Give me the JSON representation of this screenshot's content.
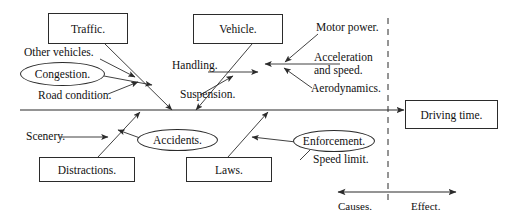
{
  "diagram": {
    "type": "fishbone-cause-and-effect",
    "colors": {
      "stroke": "#2b2b2b",
      "text": "#111111",
      "background": "#ffffff"
    },
    "effect_box": {
      "label": "Driving time."
    },
    "category_boxes": [
      {
        "id": "traffic",
        "label": "Traffic.",
        "position": "top-left"
      },
      {
        "id": "vehicle",
        "label": "Vehicle.",
        "position": "top-right"
      },
      {
        "id": "distractions",
        "label": "Distractions.",
        "position": "bottom-left"
      },
      {
        "id": "laws",
        "label": "Laws.",
        "position": "bottom-right"
      }
    ],
    "ellipses": [
      {
        "id": "congestion",
        "label": "Congestion."
      },
      {
        "id": "accidents",
        "label": "Accidents."
      },
      {
        "id": "enforcement",
        "label": "Enforcement."
      }
    ],
    "sub_causes": [
      {
        "id": "other-vehicles",
        "label": "Other vehicles.",
        "branch": "traffic"
      },
      {
        "id": "road-condition",
        "label": "Road condition.",
        "branch": "traffic"
      },
      {
        "id": "handling",
        "label": "Handling.",
        "branch": "vehicle"
      },
      {
        "id": "suspension",
        "label": "Suspension.",
        "branch": "vehicle"
      },
      {
        "id": "motor-power",
        "label": "Motor power.",
        "branch": "vehicle"
      },
      {
        "id": "acceleration-line-1",
        "label": "Acceleration",
        "branch": "vehicle"
      },
      {
        "id": "acceleration-line-2",
        "label": "and speed.",
        "branch": "vehicle"
      },
      {
        "id": "aerodynamics",
        "label": "Aerodynamics.",
        "branch": "vehicle"
      },
      {
        "id": "scenery",
        "label": "Scenery.",
        "branch": "distractions"
      },
      {
        "id": "speed-limit",
        "label": "Speed limit.",
        "branch": "laws"
      }
    ],
    "legend": {
      "causes_label": "Causes.",
      "effect_label": "Effect."
    }
  }
}
